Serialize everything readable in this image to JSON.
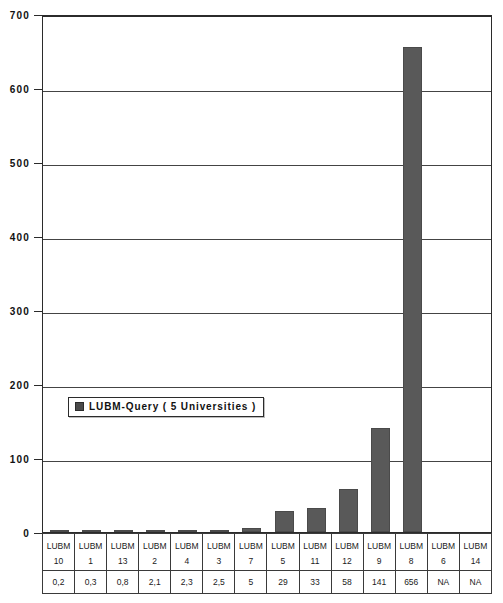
{
  "chart_data": {
    "type": "bar",
    "title": "",
    "xlabel": "",
    "ylabel": "",
    "ylim": [
      0,
      700
    ],
    "ytick_step": 100,
    "yticks": [
      "0",
      "100",
      "200",
      "300",
      "400",
      "500",
      "600",
      "700"
    ],
    "grid": true,
    "legend_position": "inside-left",
    "legend": [
      "LUBM-Query ( 5 Universities )"
    ],
    "bar_color": "#595959",
    "categories": [
      "LUBM 10",
      "LUBM 1",
      "LUBM 13",
      "LUBM 2",
      "LUBM 4",
      "LUBM 3",
      "LUBM 7",
      "LUBM 5",
      "LUBM 11",
      "LUBM 12",
      "LUBM 9",
      "LUBM 8",
      "LUBM 6",
      "LUBM 14"
    ],
    "category_name": "LUBM",
    "category_numbers": [
      "10",
      "1",
      "13",
      "2",
      "4",
      "3",
      "7",
      "5",
      "11",
      "12",
      "9",
      "8",
      "6",
      "14"
    ],
    "value_labels": [
      "0,2",
      "0,3",
      "0,8",
      "2,1",
      "2,3",
      "2,5",
      "5",
      "29",
      "33",
      "58",
      "141",
      "656",
      "NA",
      "NA"
    ],
    "values": [
      0.2,
      0.3,
      0.8,
      2.1,
      2.3,
      2.5,
      5,
      29,
      33,
      58,
      141,
      656,
      null,
      null
    ]
  },
  "legend": {
    "series_label": "LUBM-Query ( 5 Universities )"
  }
}
